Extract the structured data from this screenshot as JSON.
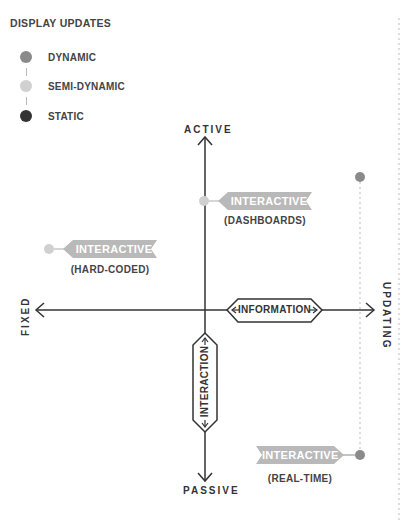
{
  "legend": {
    "title": "DISPLAY UPDATES",
    "items": [
      {
        "label": "DYNAMIC",
        "color": "#8a8a8a"
      },
      {
        "label": "SEMI-DYNAMIC",
        "color": "#d0d0d0"
      },
      {
        "label": "STATIC",
        "color": "#333333"
      }
    ]
  },
  "axes": {
    "top": "ACTIVE",
    "bottom": "PASSIVE",
    "left": "FIXED",
    "right": "UPDATING",
    "horizontal_label": "INFORMATION",
    "vertical_label": "INTERACTION"
  },
  "nodes": [
    {
      "title": "INTERACTIVE",
      "subtitle": "(DASHBOARDS)",
      "type": "semi-dynamic"
    },
    {
      "title": "INTERACTIVE",
      "subtitle": "(HARD-CODED)",
      "type": "semi-dynamic"
    },
    {
      "title": "INTERACTIVE",
      "subtitle": "(REAL-TIME)",
      "type": "dynamic"
    }
  ],
  "colors": {
    "flag": "#b9b9b9",
    "axis": "#333333",
    "dynamic": "#8a8a8a",
    "semi_dynamic": "#d0d0d0",
    "static": "#333333",
    "dotted": "#bbbbbb"
  }
}
